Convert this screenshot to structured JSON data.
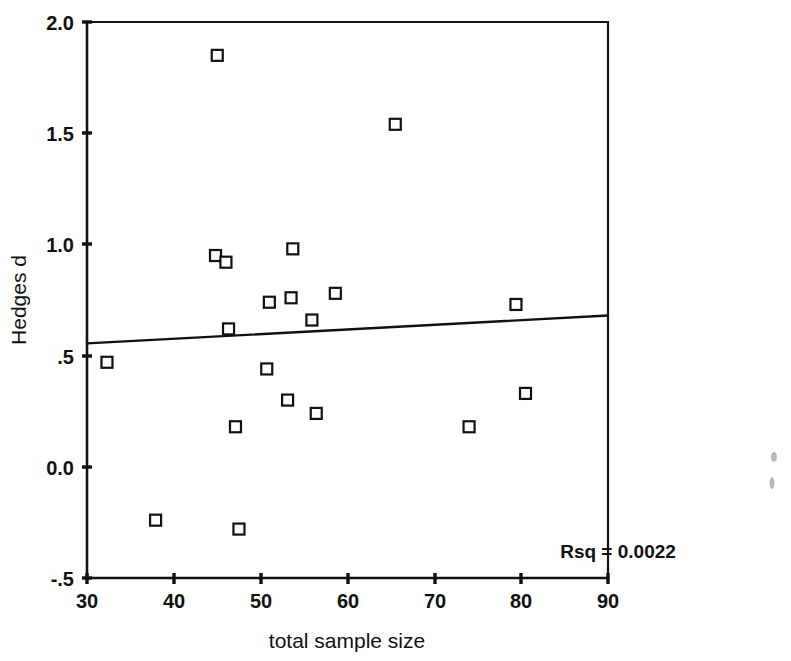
{
  "chart_data": {
    "type": "scatter",
    "title": "",
    "xlabel": "total sample size",
    "ylabel": "Hedges d",
    "xlim": [
      30,
      90
    ],
    "ylim": [
      -0.5,
      2.0
    ],
    "xticks": [
      30,
      40,
      50,
      60,
      70,
      80,
      90
    ],
    "xtick_labels": [
      "30",
      "40",
      "50",
      "60",
      "70",
      "80",
      "90"
    ],
    "yticks": [
      -0.5,
      0.0,
      0.5,
      1.0,
      1.5,
      2.0
    ],
    "ytick_labels": [
      "-.5",
      "0.0",
      ".5",
      "1.0",
      "1.5",
      "2.0"
    ],
    "grid": false,
    "legend": "none",
    "marker": "open-square",
    "points": [
      {
        "x": 32.3,
        "y": 0.47
      },
      {
        "x": 37.9,
        "y": -0.24
      },
      {
        "x": 45.0,
        "y": 1.85
      },
      {
        "x": 44.8,
        "y": 0.95
      },
      {
        "x": 46.0,
        "y": 0.92
      },
      {
        "x": 46.3,
        "y": 0.62
      },
      {
        "x": 47.1,
        "y": 0.18
      },
      {
        "x": 47.5,
        "y": -0.28
      },
      {
        "x": 51.0,
        "y": 0.74
      },
      {
        "x": 50.7,
        "y": 0.44
      },
      {
        "x": 53.7,
        "y": 0.98
      },
      {
        "x": 53.5,
        "y": 0.76
      },
      {
        "x": 53.1,
        "y": 0.3
      },
      {
        "x": 55.9,
        "y": 0.66
      },
      {
        "x": 56.4,
        "y": 0.24
      },
      {
        "x": 58.6,
        "y": 0.78
      },
      {
        "x": 65.5,
        "y": 1.54
      },
      {
        "x": 74.0,
        "y": 0.18
      },
      {
        "x": 79.4,
        "y": 0.73
      },
      {
        "x": 80.5,
        "y": 0.33
      }
    ],
    "fit_line": {
      "type": "linear-regression",
      "x_start": 30,
      "y_start": 0.555,
      "x_end": 90,
      "y_end": 0.68
    },
    "annotations": [
      {
        "name": "rsq-annotation",
        "text": "Rsq = 0.0022",
        "x": 84.5,
        "y": -0.41
      }
    ]
  },
  "icons": {
    "marker_name": "open-square-marker",
    "speck_name": "scan-artifact-speck"
  }
}
